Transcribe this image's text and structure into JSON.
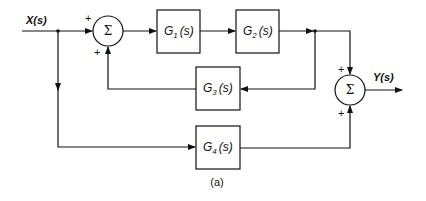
{
  "diagram": {
    "type": "block-diagram",
    "caption": "(a)",
    "input": {
      "label": "X(s)"
    },
    "output": {
      "label": "Y(s)"
    },
    "summing_junctions": [
      {
        "id": "sum1",
        "symbol": "Σ",
        "inputs": [
          {
            "from": "X(s)",
            "sign": "+"
          },
          {
            "from": "G3(s)",
            "sign": "−"
          }
        ]
      },
      {
        "id": "sum2",
        "symbol": "Σ",
        "inputs": [
          {
            "from": "G2(s)",
            "sign": "+"
          },
          {
            "from": "G4(s)",
            "sign": "+"
          }
        ]
      }
    ],
    "blocks": [
      {
        "id": "G1",
        "base": "G",
        "sub": "1",
        "arg": "(s)"
      },
      {
        "id": "G2",
        "base": "G",
        "sub": "2",
        "arg": "(s)"
      },
      {
        "id": "G3",
        "base": "G",
        "sub": "3",
        "arg": "(s)"
      },
      {
        "id": "G4",
        "base": "G",
        "sub": "4",
        "arg": "(s)"
      }
    ],
    "connections": [
      "X(s) -> sum1 (+)",
      "sum1 -> G1(s)",
      "G1(s) -> G2(s)",
      "G2(s) -> sum2 (+)",
      "G2(s) -> G3(s)",
      "G3(s) -> sum1 (−)",
      "X(s) -> G4(s)",
      "G4(s) -> sum2 (+)",
      "sum2 -> Y(s)"
    ]
  }
}
